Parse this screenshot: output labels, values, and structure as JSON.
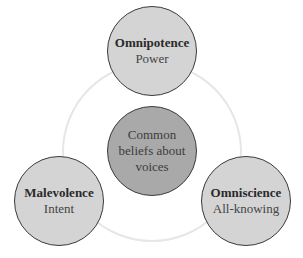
{
  "diagram": {
    "center": {
      "lines": [
        "Common",
        "beliefs about",
        "voices"
      ]
    },
    "nodes": [
      {
        "title": "Omnipotence",
        "subtitle": "Power"
      },
      {
        "title": "Malevolence",
        "subtitle": "Intent"
      },
      {
        "title": "Omniscience",
        "subtitle": "All-knowing"
      }
    ],
    "colors": {
      "node_fill": "#d4d4d4",
      "center_fill": "#a9a9a9",
      "ring": "#e6e6e6",
      "stroke": "#3a3a3a"
    }
  }
}
